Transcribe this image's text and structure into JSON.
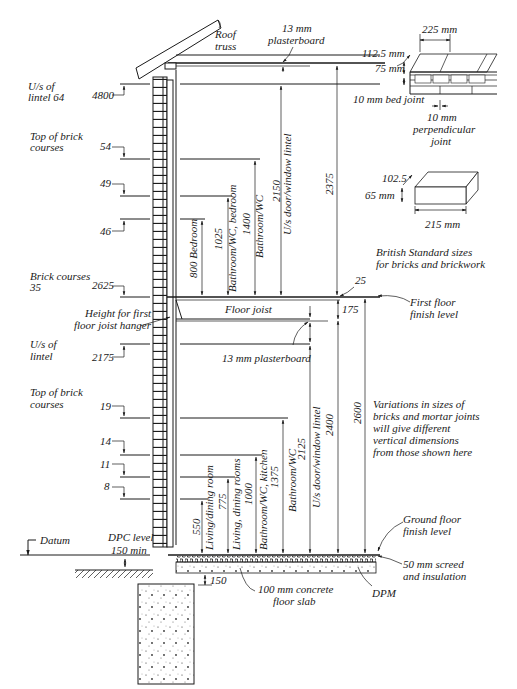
{
  "diagram": {
    "left_labels": {
      "us_lintel_64": [
        "U/s of",
        "lintel 64"
      ],
      "top_brick_upper": [
        "Top of brick",
        "courses"
      ],
      "brick_courses_35": [
        "Brick courses",
        "35"
      ],
      "us_lintel_lower": [
        "U/s of",
        "lintel"
      ],
      "top_brick_lower": [
        "Top of brick",
        "courses"
      ],
      "datum": "Datum",
      "dpc": [
        "DPC level",
        "150 min"
      ],
      "joist_hanger": [
        "Height for first",
        "floor joist hanger"
      ]
    },
    "course_marks": {
      "m4800": "4800",
      "c54": "54",
      "c49": "49",
      "c46": "46",
      "m2625": "2625",
      "m2175": "2175",
      "c19": "19",
      "c14": "14",
      "c11": "11",
      "c8": "8"
    },
    "upper_floor_dims": {
      "bedroom": "800 Bedroom",
      "bath_bed_value": "1025",
      "bath_bed_label": "Bathroom/WC, bedroom",
      "bath_value": "1400",
      "bath_label": "Bathroom/WC",
      "lintel_value": "2150",
      "lintel_label": "U/s door/window lintel",
      "ceiling": "2375",
      "joist_gap": "25"
    },
    "lower_floor_dims": {
      "living_value": "550",
      "living_label": "Living/dining room",
      "living2_value": "775",
      "living2_label": "Living, dining rooms",
      "kitchen_value": "1000",
      "kitchen_label": "Bathroom/WC, kitchen",
      "bath_value": "1375",
      "bath_label": "Bathroom/WC",
      "lintel_value": "2125",
      "lintel_label": "U/s door/window lintel",
      "to_ceiling": "2400",
      "to_first_floor": "2600",
      "joist_depth": "175",
      "slab_offset": "150"
    },
    "annotations": {
      "roof_truss": [
        "Roof",
        "truss"
      ],
      "plasterboard_top": [
        "13 mm",
        "plasterboard"
      ],
      "floor_joist": "Floor joist",
      "plasterboard_mid": "13 mm plasterboard",
      "first_floor_finish": [
        "First floor",
        "finish level"
      ],
      "ground_floor_finish": [
        "Ground floor",
        "finish level"
      ],
      "screed": [
        "50 mm screed",
        "and insulation"
      ],
      "dpm": "DPM",
      "slab": [
        "100 mm concrete",
        "floor slab"
      ],
      "variations": [
        "Variations in sizes of",
        "bricks and mortar joints",
        "will give different",
        "vertical dimensions",
        "from those shown here"
      ]
    },
    "brick_inset": {
      "length": "225 mm",
      "width": "112.5 mm",
      "height": "75 mm",
      "bed_joint": "10 mm bed joint",
      "perp_joint": [
        "10 mm",
        "perpendicular",
        "joint"
      ],
      "brick_width": "102.5",
      "brick_height": "65 mm",
      "brick_length": "215 mm",
      "caption": [
        "British Standard sizes",
        "for bricks and brickwork"
      ]
    }
  }
}
